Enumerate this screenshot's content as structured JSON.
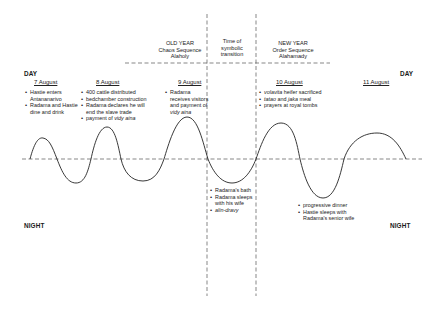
{
  "diagram": {
    "axis_labels": {
      "day_left": "DAY",
      "day_right": "DAY",
      "night_left": "NIGHT",
      "night_right": "NIGHT"
    },
    "phases": {
      "old_year": {
        "title": "OLD YEAR",
        "line2": "Chaos Sequence",
        "line3": "Alaholy"
      },
      "transition": {
        "line1": "Time of",
        "line2": "symbolic",
        "line3": "transition"
      },
      "new_year": {
        "title": "NEW YEAR",
        "line2": "Order Sequence",
        "line3": "Alahamady"
      }
    },
    "days": [
      {
        "date": "7 August",
        "day_events": [
          {
            "text": "Hastie enters Antananarivo"
          },
          {
            "text": "Radama and Hastie dine and drink"
          }
        ]
      },
      {
        "date": "8 August",
        "day_events": [
          {
            "text": "400 cattle distributed"
          },
          {
            "text": "bedchamber construction"
          },
          {
            "text": "Radama declares he will end the slave trade"
          },
          {
            "text_prefix": "payment  of ",
            "text_italic": "vidy aina"
          }
        ]
      },
      {
        "date": "9 August",
        "day_events": [
          {
            "text_prefix": "Radama receives visitors and payment of ",
            "text_italic": "vidy aina"
          }
        ],
        "night_events": [
          {
            "text": "Radama's bath"
          },
          {
            "text": "Radama sleeps with his wife"
          },
          {
            "text_italic": "alin-dravy"
          }
        ]
      },
      {
        "date": "10 August",
        "day_events": [
          {
            "text_italic": "volavita",
            "text_suffix": " heifer sacrificed"
          },
          {
            "text_italic": "tatao",
            "text_mid": " and ",
            "text_italic2": "jaka",
            "text_suffix": " meal"
          },
          {
            "text": "prayers at royal tombs"
          }
        ],
        "night_events": [
          {
            "text": "progressive dinner"
          },
          {
            "text": "Hastie sleeps with Radama's senior wife"
          }
        ]
      },
      {
        "date": "11 August"
      }
    ],
    "colors": {
      "line": "#222222",
      "dashed": "#555555",
      "text": "#1a1a1a",
      "background": "#ffffff"
    }
  }
}
